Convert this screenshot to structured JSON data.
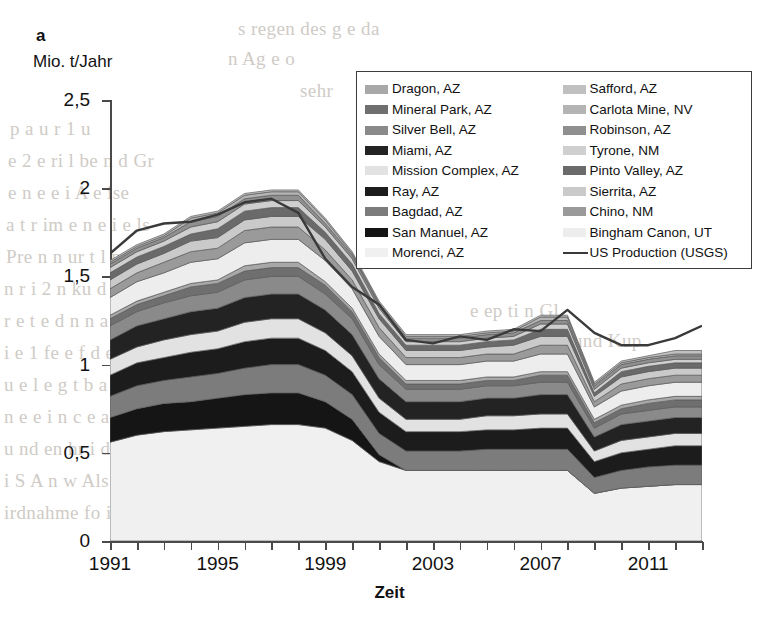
{
  "panel": {
    "letter": "a"
  },
  "axes": {
    "y_title": "Mio. t/Jahr",
    "x_title": "Zeit",
    "y_ticks": [
      "0",
      "0,5",
      "1",
      "1,5",
      "2",
      "2,5"
    ],
    "x_ticks": [
      "1991",
      "1995",
      "1999",
      "2003",
      "2007",
      "2011"
    ]
  },
  "legend": {
    "left": [
      {
        "label": "Dragon, AZ",
        "color": "#a8a8a8"
      },
      {
        "label": "Mineral Park, AZ",
        "color": "#6f6f6f"
      },
      {
        "label": "Silver Bell, AZ",
        "color": "#8a8a8a"
      },
      {
        "label": "Miami, AZ",
        "color": "#232323"
      },
      {
        "label": "Mission Complex, AZ",
        "color": "#e2e2e2"
      },
      {
        "label": "Ray, AZ",
        "color": "#1c1c1c"
      },
      {
        "label": "Bagdad, AZ",
        "color": "#7c7c7c"
      },
      {
        "label": "San Manuel, AZ",
        "color": "#151515"
      },
      {
        "label": "Morenci, AZ",
        "color": "#f0f0f0"
      }
    ],
    "right": [
      {
        "label": "Safford, AZ",
        "color": "#c0c0c0"
      },
      {
        "label": "Carlota Mine, NV",
        "color": "#b4b4b4"
      },
      {
        "label": "Robinson, AZ",
        "color": "#8f8f8f"
      },
      {
        "label": "Tyrone, NM",
        "color": "#cfcfcf"
      },
      {
        "label": "Pinto Valley, AZ",
        "color": "#6a6a6a"
      },
      {
        "label": "Sierrita, AZ",
        "color": "#cacaca"
      },
      {
        "label": "Chino, NM",
        "color": "#9a9a9a"
      },
      {
        "label": "Bingham Canon, UT",
        "color": "#ededed"
      },
      {
        "label": "US Production (USGS)",
        "color": "#3a3a3a",
        "marker": "line"
      }
    ]
  },
  "bleed_text": [
    {
      "x": 238,
      "y": 18,
      "text": "s regen des  g    e      da"
    },
    {
      "x": 228,
      "y": 48,
      "text": "n Ag   e    o"
    },
    {
      "x": 300,
      "y": 80,
      "text": "sehr"
    },
    {
      "x": 10,
      "y": 118,
      "text": "p        a      u  r 1         u"
    },
    {
      "x": 8,
      "y": 150,
      "text": "e    2   e ri    l  be   n   d  Gr"
    },
    {
      "x": 8,
      "y": 182,
      "text": "e  n   e   e    i   A     e    ise"
    },
    {
      "x": 6,
      "y": 214,
      "text": "a   t  r  im   e  n    e  i    e    ls"
    },
    {
      "x": 6,
      "y": 246,
      "text": "Pre     n    n ur   t  l    n  Sel"
    },
    {
      "x": 4,
      "y": 278,
      "text": "n  r   i   2    n  ku       d Lan"
    },
    {
      "x": 4,
      "y": 310,
      "text": "r   e   t   e     d   n   n  a   e  ch"
    },
    {
      "x": 4,
      "y": 342,
      "text": "i  e  1   fe   e     f   d    e  K  er"
    },
    {
      "x": 4,
      "y": 374,
      "text": "u  e  l  e    g        t      b   a"
    },
    {
      "x": 4,
      "y": 406,
      "text": "n  e  e  i  n    c    e       a    s"
    },
    {
      "x": 4,
      "y": 438,
      "text": "u     nd  en  hr     i   de   obe"
    },
    {
      "x": 4,
      "y": 470,
      "text": "i  S     A       n  w   Als  die  Wert  de"
    },
    {
      "x": 4,
      "y": 502,
      "text": "irdnahme  fo    ist  de  Arm  egion  und  d"
    },
    {
      "x": 470,
      "y": 300,
      "text": "e   ep    ti   n  Gl"
    },
    {
      "x": 470,
      "y": 330,
      "text": "In  Kup   r  SX    und  Kup"
    },
    {
      "x": 470,
      "y": 360,
      "text": "l  e   on  p"
    },
    {
      "x": 470,
      "y": 392,
      "text": "sine   ou   te   ni"
    },
    {
      "x": 470,
      "y": 424,
      "text": "e  er   s   d  wi   ond"
    },
    {
      "x": 470,
      "y": 456,
      "text": "in   ion  mi   de   wi  r"
    }
  ],
  "chart_data": {
    "type": "area",
    "title": "",
    "xlabel": "Zeit",
    "ylabel": "Mio. t/Jahr",
    "ylim": [
      0,
      2.5
    ],
    "xlim": [
      1991,
      2013
    ],
    "grid": false,
    "legend_position": "top-right",
    "stacked": true,
    "years": [
      1991,
      1992,
      1993,
      1994,
      1995,
      1996,
      1997,
      1998,
      1999,
      2000,
      2001,
      2002,
      2003,
      2004,
      2005,
      2006,
      2007,
      2008,
      2009,
      2010,
      2011,
      2012,
      2013
    ],
    "series": [
      {
        "name": "Morenci, AZ",
        "color": "#f0f0f0",
        "values": [
          0.56,
          0.6,
          0.62,
          0.63,
          0.64,
          0.65,
          0.66,
          0.66,
          0.64,
          0.57,
          0.45,
          0.4,
          0.4,
          0.4,
          0.4,
          0.4,
          0.4,
          0.4,
          0.27,
          0.3,
          0.31,
          0.32,
          0.32
        ]
      },
      {
        "name": "San Manuel, AZ",
        "color": "#151515",
        "values": [
          0.14,
          0.15,
          0.16,
          0.16,
          0.17,
          0.18,
          0.18,
          0.18,
          0.15,
          0.12,
          0.04,
          0.0,
          0.0,
          0.0,
          0.0,
          0.0,
          0.0,
          0.0,
          0.0,
          0.0,
          0.0,
          0.0,
          0.0
        ]
      },
      {
        "name": "Bagdad, AZ",
        "color": "#7c7c7c",
        "values": [
          0.12,
          0.13,
          0.13,
          0.14,
          0.14,
          0.15,
          0.16,
          0.16,
          0.15,
          0.14,
          0.12,
          0.11,
          0.11,
          0.11,
          0.12,
          0.12,
          0.12,
          0.12,
          0.09,
          0.1,
          0.11,
          0.11,
          0.11
        ]
      },
      {
        "name": "Ray, AZ",
        "color": "#1c1c1c",
        "values": [
          0.12,
          0.13,
          0.13,
          0.14,
          0.14,
          0.15,
          0.15,
          0.15,
          0.14,
          0.13,
          0.12,
          0.11,
          0.11,
          0.11,
          0.11,
          0.11,
          0.12,
          0.12,
          0.09,
          0.1,
          0.1,
          0.11,
          0.11
        ]
      },
      {
        "name": "Mission Complex, AZ",
        "color": "#e2e2e2",
        "values": [
          0.09,
          0.09,
          0.1,
          0.1,
          0.1,
          0.11,
          0.11,
          0.11,
          0.1,
          0.09,
          0.08,
          0.07,
          0.07,
          0.07,
          0.08,
          0.08,
          0.08,
          0.08,
          0.06,
          0.07,
          0.07,
          0.07,
          0.07
        ]
      },
      {
        "name": "Miami, AZ",
        "color": "#232323",
        "values": [
          0.11,
          0.12,
          0.12,
          0.13,
          0.13,
          0.14,
          0.14,
          0.14,
          0.13,
          0.12,
          0.11,
          0.1,
          0.1,
          0.1,
          0.1,
          0.1,
          0.11,
          0.11,
          0.08,
          0.09,
          0.09,
          0.09,
          0.09
        ]
      },
      {
        "name": "Silver Bell, AZ",
        "color": "#8a8a8a",
        "values": [
          0.08,
          0.08,
          0.09,
          0.09,
          0.09,
          0.1,
          0.1,
          0.1,
          0.09,
          0.09,
          0.08,
          0.07,
          0.07,
          0.07,
          0.07,
          0.07,
          0.07,
          0.07,
          0.05,
          0.06,
          0.06,
          0.06,
          0.06
        ]
      },
      {
        "name": "Mineral Park, AZ",
        "color": "#6f6f6f",
        "values": [
          0.04,
          0.04,
          0.04,
          0.05,
          0.05,
          0.05,
          0.05,
          0.05,
          0.05,
          0.04,
          0.04,
          0.03,
          0.03,
          0.03,
          0.03,
          0.03,
          0.04,
          0.04,
          0.03,
          0.03,
          0.04,
          0.04,
          0.04
        ]
      },
      {
        "name": "Dragon, AZ",
        "color": "#a8a8a8",
        "values": [
          0.02,
          0.02,
          0.02,
          0.02,
          0.02,
          0.03,
          0.03,
          0.03,
          0.02,
          0.02,
          0.02,
          0.02,
          0.02,
          0.02,
          0.02,
          0.02,
          0.02,
          0.02,
          0.02,
          0.02,
          0.02,
          0.02,
          0.02
        ]
      },
      {
        "name": "Bingham Canon, UT",
        "color": "#ededed",
        "values": [
          0.1,
          0.11,
          0.11,
          0.12,
          0.12,
          0.13,
          0.13,
          0.13,
          0.12,
          0.11,
          0.1,
          0.09,
          0.09,
          0.09,
          0.09,
          0.09,
          0.1,
          0.1,
          0.07,
          0.08,
          0.08,
          0.08,
          0.08
        ]
      },
      {
        "name": "Chino, NM",
        "color": "#9a9a9a",
        "values": [
          0.05,
          0.05,
          0.06,
          0.06,
          0.06,
          0.07,
          0.07,
          0.07,
          0.06,
          0.05,
          0.05,
          0.04,
          0.04,
          0.04,
          0.04,
          0.04,
          0.05,
          0.05,
          0.03,
          0.04,
          0.04,
          0.04,
          0.04
        ]
      },
      {
        "name": "Sierrita, AZ",
        "color": "#cacaca",
        "values": [
          0.05,
          0.05,
          0.05,
          0.06,
          0.06,
          0.06,
          0.06,
          0.06,
          0.06,
          0.05,
          0.05,
          0.04,
          0.04,
          0.04,
          0.04,
          0.05,
          0.05,
          0.05,
          0.03,
          0.04,
          0.04,
          0.04,
          0.04
        ]
      },
      {
        "name": "Pinto Valley, AZ",
        "color": "#6a6a6a",
        "values": [
          0.04,
          0.04,
          0.04,
          0.04,
          0.05,
          0.05,
          0.05,
          0.05,
          0.04,
          0.04,
          0.03,
          0.03,
          0.03,
          0.03,
          0.03,
          0.03,
          0.04,
          0.04,
          0.02,
          0.03,
          0.03,
          0.03,
          0.03
        ]
      },
      {
        "name": "Tyrone, NM",
        "color": "#cfcfcf",
        "values": [
          0.03,
          0.03,
          0.03,
          0.04,
          0.04,
          0.04,
          0.04,
          0.04,
          0.03,
          0.03,
          0.03,
          0.02,
          0.02,
          0.02,
          0.02,
          0.02,
          0.03,
          0.03,
          0.02,
          0.02,
          0.02,
          0.02,
          0.02
        ]
      },
      {
        "name": "Robinson, AZ",
        "color": "#8f8f8f",
        "values": [
          0.02,
          0.02,
          0.02,
          0.03,
          0.03,
          0.03,
          0.03,
          0.03,
          0.02,
          0.02,
          0.02,
          0.02,
          0.02,
          0.02,
          0.02,
          0.02,
          0.02,
          0.02,
          0.02,
          0.02,
          0.02,
          0.02,
          0.02
        ]
      },
      {
        "name": "Carlota Mine, NV",
        "color": "#b4b4b4",
        "values": [
          0.01,
          0.01,
          0.01,
          0.02,
          0.02,
          0.02,
          0.02,
          0.02,
          0.02,
          0.01,
          0.01,
          0.01,
          0.01,
          0.01,
          0.01,
          0.01,
          0.02,
          0.02,
          0.01,
          0.01,
          0.01,
          0.01,
          0.01
        ]
      },
      {
        "name": "Safford, AZ",
        "color": "#c0c0c0",
        "values": [
          0.01,
          0.01,
          0.01,
          0.01,
          0.01,
          0.01,
          0.01,
          0.01,
          0.01,
          0.01,
          0.01,
          0.01,
          0.01,
          0.01,
          0.01,
          0.01,
          0.01,
          0.01,
          0.01,
          0.01,
          0.01,
          0.02,
          0.02
        ]
      }
    ],
    "line_series": {
      "name": "US Production (USGS)",
      "color": "#3a3a3a",
      "values": [
        1.63,
        1.76,
        1.8,
        1.81,
        1.85,
        1.92,
        1.94,
        1.86,
        1.6,
        1.44,
        1.34,
        1.14,
        1.12,
        1.16,
        1.14,
        1.2,
        1.19,
        1.31,
        1.18,
        1.11,
        1.11,
        1.15,
        1.22
      ]
    }
  }
}
